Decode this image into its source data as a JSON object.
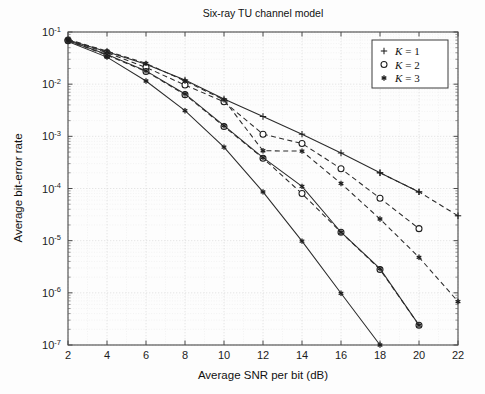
{
  "figure": {
    "title": "Six-ray TU channel model",
    "width": 485,
    "height": 394,
    "background": "#fdfdfd"
  },
  "axes": {
    "x": {
      "label": "Average SNR per bit (dB)",
      "min": 2,
      "max": 22,
      "tick_step": 2,
      "ticks": [
        "2",
        "4",
        "6",
        "8",
        "10",
        "12",
        "14",
        "16",
        "18",
        "20",
        "22"
      ],
      "scale": "linear"
    },
    "y": {
      "label": "Average bit-error rate",
      "min": 1e-07,
      "max": 0.1,
      "scale": "log",
      "ticks": [
        "10-1",
        "10-2",
        "10-3",
        "10-4",
        "10-5",
        "10-6",
        "10-7"
      ],
      "tick_mantissa": "10",
      "tick_exponents": [
        "-1",
        "-2",
        "-3",
        "-4",
        "-5",
        "-6",
        "-7"
      ]
    },
    "grid": "minor-and-major-dotted",
    "box": true
  },
  "legend": {
    "position": "top-right",
    "entries": [
      {
        "marker": "plus-marker",
        "label_var": "K",
        "label_eq": "= 1",
        "label": "K = 1"
      },
      {
        "marker": "circle-marker",
        "label_var": "K",
        "label_eq": "= 2",
        "label": "K = 2"
      },
      {
        "marker": "asterisk-marker",
        "label_var": "K",
        "label_eq": "= 3",
        "label": "K = 3"
      }
    ]
  },
  "colors": {
    "line": "#2b2b2b",
    "axis": "#4a4a4a",
    "grid_major": "#d2d2d2",
    "grid_minor": "#e7e7e7",
    "text": "#111111",
    "legend_border": "#3c3c3c",
    "background": "#fdfdfd"
  },
  "chart_data": {
    "type": "line",
    "title": "Six-ray TU channel model",
    "xlabel": "Average SNR per bit (dB)",
    "ylabel": "Average bit-error rate",
    "xlim": [
      2,
      22
    ],
    "ylim": [
      1e-07,
      0.1
    ],
    "yscale": "log",
    "xscale": "linear",
    "grid": true,
    "legend_position": "upper right",
    "legend": [
      "K = 1",
      "K = 2",
      "K = 3"
    ],
    "series": [
      {
        "name": "K = 1 (upper, solid)",
        "marker": "+",
        "linestyle": "solid",
        "x": [
          2,
          4,
          6,
          8,
          10,
          12,
          14,
          16,
          18,
          20
        ],
        "y": [
          0.07,
          0.042,
          0.024,
          0.012,
          0.0052,
          0.0024,
          0.0011,
          0.00048,
          0.0002,
          8.6e-05
        ]
      },
      {
        "name": "K = 1 (lower, dashed)",
        "marker": "+",
        "linestyle": "dashed",
        "x": [
          18,
          20,
          22
        ],
        "y": [
          0.0002,
          8.6e-05,
          3e-05
        ]
      },
      {
        "name": "K = 2 (upper, dashed)",
        "marker": "o",
        "linestyle": "dashed",
        "x": [
          2,
          4,
          6,
          8,
          10,
          12,
          14,
          16,
          18,
          20
        ],
        "y": [
          0.07,
          0.04,
          0.021,
          0.0096,
          0.0046,
          0.0011,
          0.00073,
          0.00024,
          6.5e-05,
          1.7e-05
        ]
      },
      {
        "name": "K = 2 (lower, dashed)",
        "marker": "o",
        "linestyle": "dashed",
        "x": [
          2,
          4,
          6,
          8,
          10,
          12,
          14,
          16,
          18,
          20
        ],
        "y": [
          0.068,
          0.036,
          0.0175,
          0.0063,
          0.00155,
          0.00038,
          8e-05,
          1.45e-05,
          2.8e-06,
          2.4e-07
        ]
      },
      {
        "name": "K = 3 (upper, dashed)",
        "marker": "*",
        "linestyle": "dashed",
        "x": [
          2,
          4,
          6,
          8,
          10,
          12,
          14,
          16,
          18,
          20,
          22
        ],
        "y": [
          0.072,
          0.043,
          0.025,
          0.0115,
          0.005,
          0.00053,
          0.00052,
          0.000125,
          2.6e-05,
          4.8e-06,
          6.8e-07
        ]
      },
      {
        "name": "K = 3 (middle, solid)",
        "marker": "*",
        "linestyle": "solid",
        "x": [
          2,
          4,
          6,
          8,
          10,
          12,
          14,
          16,
          18,
          20
        ],
        "y": [
          0.069,
          0.037,
          0.018,
          0.0065,
          0.0016,
          0.00039,
          0.00011,
          1.45e-05,
          2.9e-06,
          2.4e-07
        ]
      },
      {
        "name": "K = 3 (lowest, solid)",
        "marker": "*",
        "linestyle": "solid",
        "x": [
          2,
          4,
          6,
          8,
          10,
          12,
          14,
          16,
          18
        ],
        "y": [
          0.066,
          0.033,
          0.0115,
          0.0031,
          0.00062,
          8.6e-05,
          9.8e-06,
          9.8e-07,
          1e-07
        ]
      }
    ]
  }
}
